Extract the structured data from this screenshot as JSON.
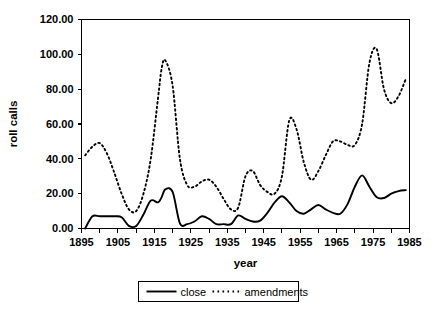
{
  "chart_data": {
    "type": "line",
    "title": "",
    "xlabel": "year",
    "ylabel": "roll calls",
    "xlim": [
      1895,
      1985
    ],
    "ylim": [
      0,
      120
    ],
    "grid": false,
    "legend_position": "bottom",
    "x_tick_labels": [
      "1895",
      "1905",
      "1915",
      "1925",
      "1935",
      "1945",
      "1955",
      "1965",
      "1975",
      "1985"
    ],
    "x_tick_values": [
      1895,
      1905,
      1915,
      1925,
      1935,
      1945,
      1955,
      1965,
      1975,
      1985
    ],
    "x_minor_tick_values": [
      1900,
      1910,
      1920,
      1930,
      1940,
      1950,
      1960,
      1970,
      1980
    ],
    "y_tick_labels": [
      "0.00",
      "20.00",
      "40.00",
      "60.00",
      "80.00",
      "100.00",
      "120.00"
    ],
    "y_tick_values": [
      0,
      20,
      40,
      60,
      80,
      100,
      120
    ],
    "x": [
      1896,
      1898,
      1900,
      1902,
      1904,
      1906,
      1908,
      1910,
      1912,
      1914,
      1916,
      1917,
      1918,
      1920,
      1922,
      1924,
      1926,
      1928,
      1930,
      1932,
      1934,
      1936,
      1938,
      1940,
      1942,
      1944,
      1946,
      1948,
      1950,
      1952,
      1954,
      1956,
      1958,
      1960,
      1962,
      1964,
      1966,
      1968,
      1970,
      1972,
      1974,
      1976,
      1978,
      1980,
      1982,
      1984
    ],
    "series": [
      {
        "name": "close",
        "style": "solid",
        "color": "#000000",
        "values": [
          0,
          7,
          7,
          7,
          7,
          6.5,
          1.5,
          1.5,
          8,
          16,
          15,
          18,
          22.5,
          21,
          3,
          2.5,
          4,
          7,
          5.5,
          2.5,
          2.5,
          2.5,
          7.5,
          5.5,
          4,
          4.5,
          9,
          15,
          18.5,
          15,
          10,
          8.5,
          11,
          13.5,
          11,
          9,
          8.5,
          14,
          24,
          30.5,
          24,
          18,
          17.5,
          20,
          21.5,
          22
        ]
      },
      {
        "name": "amendments",
        "style": "dotted",
        "color": "#000000",
        "values": [
          42,
          47,
          49,
          43,
          32,
          20,
          11,
          10,
          20,
          40,
          75,
          92,
          96.5,
          82,
          40,
          25,
          24,
          27,
          28,
          24,
          17,
          11,
          12,
          30,
          33,
          25,
          21,
          20,
          30,
          62,
          57,
          38,
          28,
          33,
          42,
          50,
          50,
          48,
          48,
          60,
          95,
          103,
          80,
          72,
          76,
          86
        ]
      }
    ]
  },
  "axes": {
    "ylabel": "roll calls",
    "xlabel": "year"
  },
  "legend": {
    "items": [
      {
        "label": "close",
        "style": "solid"
      },
      {
        "label": "amendments",
        "style": "dotted"
      }
    ]
  }
}
